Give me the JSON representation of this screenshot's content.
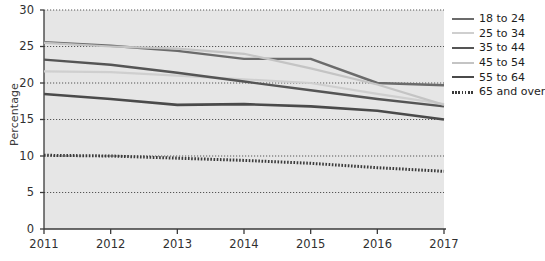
{
  "chart_data": {
    "type": "line",
    "title": "",
    "subtitle": "",
    "xlabel": "",
    "ylabel": "Percentage",
    "x": [
      "2011",
      "2012",
      "2013",
      "2014",
      "2015",
      "2016",
      "2017"
    ],
    "categories": [
      "2011",
      "2012",
      "2013",
      "2014",
      "2015",
      "2016",
      "2017"
    ],
    "xlim": [
      2011,
      2017
    ],
    "ylim": [
      0,
      30
    ],
    "y_ticks": [
      0,
      5,
      10,
      15,
      20,
      25,
      30
    ],
    "x_ticks": [
      "2011",
      "2012",
      "2013",
      "2014",
      "2015",
      "2016",
      "2017"
    ],
    "grid": "horizontal-dotted",
    "legend_position": "right",
    "plot_background": "#e6e6e6",
    "series": [
      {
        "name": "18 to 24",
        "color": "#6b6b6b",
        "style": "solid",
        "width": 2.4,
        "values": [
          25.6,
          25.1,
          24.4,
          23.3,
          23.3,
          20.0,
          19.7
        ]
      },
      {
        "name": "25 to 34",
        "color": "#cfcfcf",
        "style": "solid",
        "width": 2.2,
        "values": [
          21.6,
          21.5,
          21.0,
          20.5,
          20.0,
          18.5,
          17.1
        ]
      },
      {
        "name": "35 to 44",
        "color": "#555555",
        "style": "solid",
        "width": 2.4,
        "values": [
          23.2,
          22.5,
          21.4,
          20.2,
          19.0,
          17.8,
          16.8
        ]
      },
      {
        "name": "45 to 54",
        "color": "#c4c4c4",
        "style": "solid",
        "width": 2.2,
        "values": [
          25.5,
          25.0,
          24.7,
          24.0,
          22.0,
          19.8,
          17.0
        ]
      },
      {
        "name": "55 to 64",
        "color": "#4a4a4a",
        "style": "solid",
        "width": 2.6,
        "values": [
          18.5,
          17.8,
          17.0,
          17.1,
          16.8,
          16.2,
          15.0
        ]
      },
      {
        "name": "65 and over",
        "color": "#3a3a3a",
        "style": "dotted",
        "width": 3.0,
        "values": [
          10.1,
          10.0,
          9.7,
          9.4,
          9.0,
          8.4,
          7.9
        ]
      }
    ]
  },
  "axes": {
    "y_title": "Percentage",
    "y_tick_labels": [
      "30",
      "25",
      "20",
      "15",
      "10",
      "5",
      "0"
    ],
    "x_tick_labels": [
      "2011",
      "2012",
      "2013",
      "2014",
      "2015",
      "2016",
      "2017"
    ]
  },
  "legend": {
    "items": [
      {
        "label": "18 to 24"
      },
      {
        "label": "25 to 34"
      },
      {
        "label": "35 to 44"
      },
      {
        "label": "45 to 54"
      },
      {
        "label": "55 to 64"
      },
      {
        "label": "65 and over"
      }
    ]
  }
}
